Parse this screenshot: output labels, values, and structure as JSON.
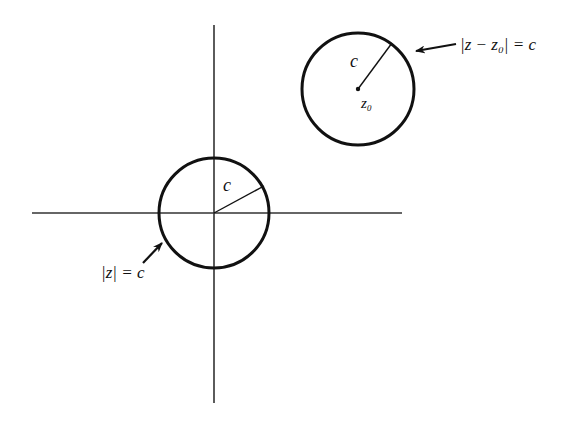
{
  "figure": {
    "type": "complex-plane-circles",
    "axes": {
      "horizontal": {
        "x1": 32,
        "y1": 213,
        "x2": 402,
        "y2": 213
      },
      "vertical": {
        "x1": 214,
        "y1": 25,
        "x2": 214,
        "y2": 403
      }
    },
    "circles": [
      {
        "id": "origin-circle",
        "center": {
          "x": 214,
          "y": 213
        },
        "radius": 55,
        "radius_line_end": {
          "x": 264,
          "y": 186
        },
        "radius_label": "c",
        "equation_label": "|z| = c",
        "center_label": ""
      },
      {
        "id": "shifted-circle",
        "center": {
          "x": 358,
          "y": 89
        },
        "radius": 56,
        "radius_line_end": {
          "x": 392,
          "y": 43
        },
        "radius_label": "c",
        "equation_label": "|z − z₀| = c",
        "center_label": "z₀"
      }
    ],
    "arrows": [
      {
        "for": "origin-circle",
        "from": {
          "x": 143,
          "y": 262
        },
        "to": {
          "x": 163,
          "y": 242
        }
      },
      {
        "for": "shifted-circle",
        "from": {
          "x": 456,
          "y": 44
        },
        "to": {
          "x": 414,
          "y": 51
        }
      }
    ],
    "colors": {
      "stroke": "#111111",
      "background": "#ffffff"
    }
  }
}
